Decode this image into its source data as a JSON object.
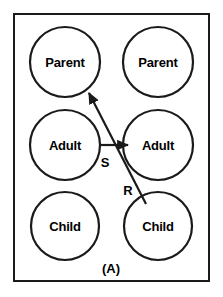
{
  "figure": {
    "caption": "(A)",
    "background_color": "#ffffff",
    "stroke_color": "#1a1a1a",
    "text_color": "#000000",
    "border": {
      "x": 13,
      "y": 13,
      "width": 197,
      "height": 269,
      "thickness": 2
    }
  },
  "diagram_data": {
    "type": "diagram",
    "title": "(A)",
    "description": "Transactional analysis ego-state diagram: two persons each represented by a vertical stack of three circles labelled Parent, Adult, Child. A stimulus arrow S runs from the left person's Adult to the right person's Adult. A response arrow R runs from the right person's Child to the left person's Parent (a crossed transaction).",
    "columns": [
      {
        "name": "left-person",
        "cx": 65
      },
      {
        "name": "right-person",
        "cx": 158
      }
    ],
    "nodes": [
      {
        "id": "left-parent",
        "label": "Parent",
        "cx": 65,
        "cy": 62,
        "r": 35
      },
      {
        "id": "right-parent",
        "label": "Parent",
        "cx": 158,
        "cy": 62,
        "r": 35
      },
      {
        "id": "left-adult",
        "label": "Adult",
        "cx": 65,
        "cy": 145,
        "r": 35
      },
      {
        "id": "right-adult",
        "label": "Adult",
        "cx": 158,
        "cy": 145,
        "r": 35
      },
      {
        "id": "left-child",
        "label": "Child",
        "cx": 65,
        "cy": 226,
        "r": 34
      },
      {
        "id": "right-child",
        "label": "Child",
        "cx": 158,
        "cy": 226,
        "r": 34
      }
    ],
    "edges": [
      {
        "id": "stimulus",
        "label": "S",
        "from": "left-adult",
        "to": "right-adult",
        "label_x": 105,
        "label_y": 162,
        "x1": 100,
        "y1": 145,
        "x2": 128,
        "y2": 145,
        "arrowhead": "end"
      },
      {
        "id": "response",
        "label": "R",
        "from": "right-child",
        "to": "left-parent",
        "label_x": 128,
        "label_y": 190,
        "x1": 146,
        "y1": 204,
        "x2": 88,
        "y2": 92,
        "arrowhead": "end"
      }
    ],
    "caption_x": 111,
    "caption_y": 268
  }
}
